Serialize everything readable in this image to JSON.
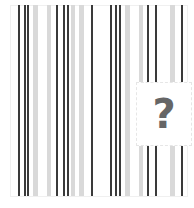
{
  "image": {
    "description": "barcode-like vertical stripe pattern with missing-image placeholder",
    "placeholder": {
      "glyph": "?",
      "icon": "question-mark-icon"
    },
    "colors": {
      "dark_bar": "#3a3a3a",
      "light_bar": "#d9d9d9",
      "glyph": "#666666",
      "background": "#ffffff"
    },
    "bars": [
      {
        "x": 18,
        "w": 2,
        "tone": "dark"
      },
      {
        "x": 24,
        "w": 2,
        "tone": "dark"
      },
      {
        "x": 27,
        "w": 2,
        "tone": "dark"
      },
      {
        "x": 33,
        "w": 5,
        "tone": "light"
      },
      {
        "x": 47,
        "w": 4,
        "tone": "light"
      },
      {
        "x": 56,
        "w": 2,
        "tone": "dark"
      },
      {
        "x": 63,
        "w": 2,
        "tone": "dark"
      },
      {
        "x": 67,
        "w": 2,
        "tone": "dark"
      },
      {
        "x": 71,
        "w": 4,
        "tone": "light"
      },
      {
        "x": 79,
        "w": 5,
        "tone": "light"
      },
      {
        "x": 91,
        "w": 2,
        "tone": "dark"
      },
      {
        "x": 110,
        "w": 2,
        "tone": "dark"
      },
      {
        "x": 115,
        "w": 2,
        "tone": "dark"
      },
      {
        "x": 119,
        "w": 2,
        "tone": "dark"
      },
      {
        "x": 125,
        "w": 5,
        "tone": "light"
      },
      {
        "x": 139,
        "w": 4,
        "tone": "light"
      },
      {
        "x": 147,
        "w": 2,
        "tone": "dark"
      },
      {
        "x": 155,
        "w": 2,
        "tone": "dark"
      },
      {
        "x": 170,
        "w": 5,
        "tone": "light"
      },
      {
        "x": 181,
        "w": 2,
        "tone": "dark"
      }
    ]
  }
}
